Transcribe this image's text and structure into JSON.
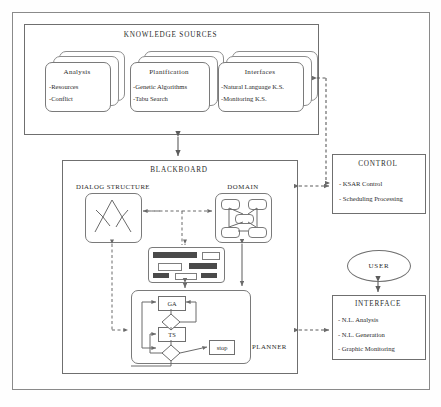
{
  "diagram": {
    "knowledge_sources": {
      "title": "KNOWLEDGE SOURCES",
      "cards": [
        {
          "name": "Analysis",
          "items": [
            "-Resources",
            "-Conflict"
          ]
        },
        {
          "name": "Planification",
          "items": [
            "-Genetic Algorithms",
            "-Tabu Search"
          ]
        },
        {
          "name": "Interfaces",
          "items": [
            "-Natural Language K.S.",
            "-Monitoring K.S."
          ]
        }
      ]
    },
    "blackboard": {
      "title": "BLACKBOARD",
      "dialog_structure_label": "DIALOG STRUCTURE",
      "domain_label": "DOMAIN",
      "planner": {
        "label": "PLANNER",
        "ga_label": "GA",
        "ts_label": "TS",
        "stop_label": "stop",
        "branch_yes": "Y"
      }
    },
    "control": {
      "title": "CONTROL",
      "items": [
        "- KSAR Control",
        "- Scheduling Processing"
      ]
    },
    "user": {
      "label": "USER"
    },
    "interface": {
      "title": "INTERFACE",
      "items": [
        "- N.L. Analysis",
        "- N.L. Generation",
        "- Graphic Monitoring"
      ]
    },
    "colors": {
      "line": "#6f6f6f",
      "soft_line": "#8d8d8d",
      "widget_fill": "#4a4a4a",
      "text": "#2b2b2b",
      "background": "#fefefe"
    }
  }
}
